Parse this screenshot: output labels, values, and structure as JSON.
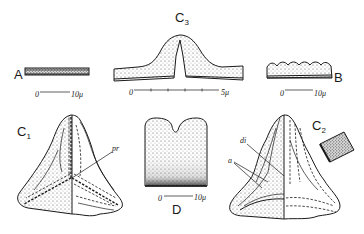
{
  "figure": {
    "panels": {
      "A": {
        "label": "A",
        "scale": {
          "zero": "0",
          "end": "10μ"
        }
      },
      "B": {
        "label": "B",
        "scale": {
          "zero": "0",
          "end": "10μ"
        }
      },
      "C3": {
        "label": "C",
        "subscript": "3",
        "scale": {
          "zero": "0",
          "end": "5μ"
        }
      },
      "C1": {
        "label": "C",
        "subscript": "1",
        "annotations": [
          "pr"
        ]
      },
      "C2": {
        "label": "C",
        "subscript": "2",
        "annotations": [
          "di",
          "a"
        ]
      },
      "D": {
        "label": "D",
        "scale": {
          "zero": "0",
          "end": "10μ"
        }
      }
    },
    "colors": {
      "ink": "#1a1a1a",
      "background": "#ffffff",
      "stipple": "#8a8a8a"
    }
  }
}
